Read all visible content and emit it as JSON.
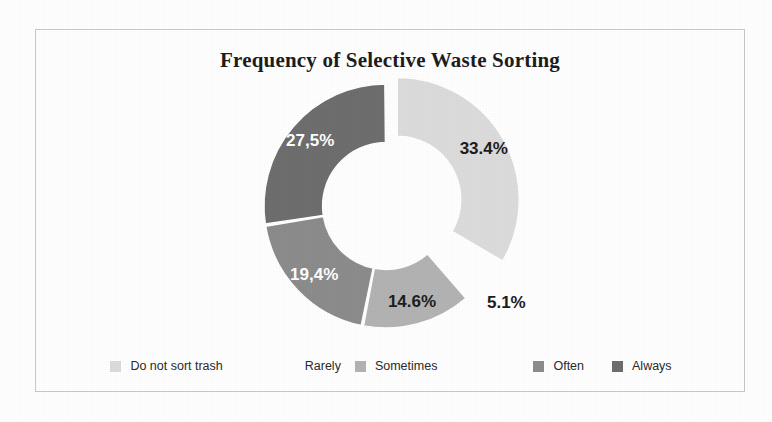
{
  "chart_data": {
    "type": "pie",
    "variant": "doughnut",
    "title": "Frequency of Selective Waste Sorting",
    "categories": [
      "Do not sort trash",
      "Rarely",
      "Sometimes",
      "Often",
      "Always"
    ],
    "values": [
      33.4,
      5.1,
      14.6,
      19.4,
      27.5
    ],
    "value_labels": [
      "33.4%",
      "5.1%",
      "14.6%",
      "19,4%",
      "27,5%"
    ],
    "unit": "%",
    "legend_position": "bottom",
    "grid": false,
    "start_angle_deg": 0,
    "direction": "clockwise",
    "exploded_slices": [
      "Do not sort trash"
    ],
    "slice_colors": [
      "#dcdcdc",
      "#ffffff",
      "#b3b3b3",
      "#8c8c8c",
      "#6e6e6e"
    ],
    "slice_label_colors": [
      "#1d1d1d",
      "#1d1d1d",
      "#1d1d1d",
      "#ffffff",
      "#ffffff"
    ],
    "hole_ratio": 0.52
  },
  "frame": {
    "border_color": "#c9c9c9",
    "background": "#ffffff"
  },
  "legend": {
    "items": [
      {
        "label": "Do not sort trash",
        "color": "#dcdcdc"
      },
      {
        "label": "Rarely",
        "color": "#ffffff"
      },
      {
        "label": "Sometimes",
        "color": "#b3b3b3"
      },
      {
        "label": "Often",
        "color": "#8c8c8c"
      },
      {
        "label": "Always",
        "color": "#6e6e6e"
      }
    ]
  }
}
